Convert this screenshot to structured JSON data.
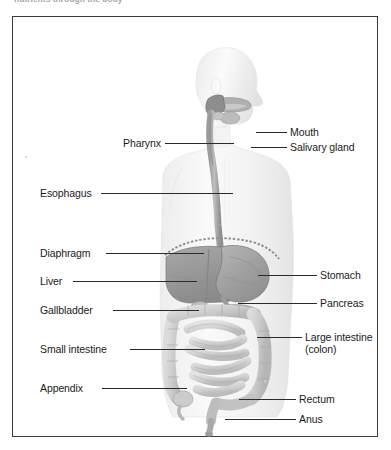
{
  "caption": {
    "text": "nutrients through the body"
  },
  "figure": {
    "labels_left": [
      {
        "name": "pharynx",
        "text": "Pharynx",
        "x": 110,
        "y": 121,
        "line_x": 152,
        "line_y": 126,
        "line_w": 69
      },
      {
        "name": "esophagus",
        "text": "Esophagus",
        "x": 27,
        "y": 171,
        "line_x": 88,
        "line_y": 176,
        "line_w": 132
      },
      {
        "name": "diaphragm",
        "text": "Diaphragm",
        "x": 27,
        "y": 231,
        "line_x": 93,
        "line_y": 236,
        "line_w": 98
      },
      {
        "name": "liver",
        "text": "Liver",
        "x": 27,
        "y": 259,
        "line_x": 60,
        "line_y": 264,
        "line_w": 124
      },
      {
        "name": "gallbladder",
        "text": "Gallbladder",
        "x": 27,
        "y": 288,
        "line_x": 100,
        "line_y": 293,
        "line_w": 86
      },
      {
        "name": "small-intestine",
        "text": "Small intestine",
        "x": 27,
        "y": 327,
        "line_x": 117,
        "line_y": 332,
        "line_w": 75
      },
      {
        "name": "appendix",
        "text": "Appendix",
        "x": 27,
        "y": 366,
        "line_x": 89,
        "line_y": 371,
        "line_w": 85
      }
    ],
    "labels_right": [
      {
        "name": "mouth",
        "text": "Mouth",
        "x": 277,
        "y": 110,
        "line_x": 243,
        "line_y": 115,
        "line_w": 31
      },
      {
        "name": "salivary-gland",
        "text": "Salivary gland",
        "x": 277,
        "y": 125,
        "line_x": 238,
        "line_y": 130,
        "line_w": 36
      },
      {
        "name": "stomach",
        "text": "Stomach",
        "x": 307,
        "y": 253,
        "line_x": 245,
        "line_y": 258,
        "line_w": 59
      },
      {
        "name": "pancreas",
        "text": "Pancreas",
        "x": 307,
        "y": 281,
        "line_x": 225,
        "line_y": 286,
        "line_w": 79
      },
      {
        "name": "large-intestine",
        "text": "Large intestine",
        "x": 292,
        "y": 315,
        "line_x": 244,
        "line_y": 320,
        "line_w": 45
      },
      {
        "name": "rectum",
        "text": "Rectum",
        "x": 286,
        "y": 377,
        "line_x": 226,
        "line_y": 382,
        "line_w": 57
      },
      {
        "name": "anus",
        "text": "Anus",
        "x": 286,
        "y": 397,
        "line_x": 212,
        "line_y": 402,
        "line_w": 71
      }
    ],
    "large_intestine_second_line": "(colon)",
    "colors": {
      "body_silhouette": "#f4f4f4",
      "body_shade": "#e6e6e6",
      "organ_dark": "#9a9a9a",
      "organ_mid": "#bdbdbd",
      "organ_light": "#d8d8d8",
      "leader_line": "#2a2a2a",
      "frame_border": "#3b3b3b",
      "label_text": "#1b1b1b",
      "background": "#ffffff"
    }
  }
}
